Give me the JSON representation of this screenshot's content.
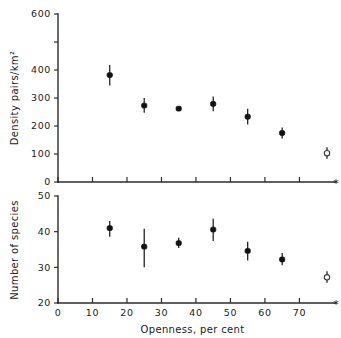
{
  "figure": {
    "name": "density-and-species-vs-openness",
    "background": "#ffffff",
    "marker_color": "#111111",
    "axis_color": "#2b2b2b",
    "end_marker": "*"
  },
  "chart_data": [
    {
      "type": "scatter",
      "panel": "top",
      "title": "",
      "xlabel": "",
      "ylabel": "Density pairs/km²",
      "xlim": [
        0,
        78
      ],
      "ylim": [
        0,
        600
      ],
      "grid": false,
      "legend": null,
      "x_ticks": [
        0,
        10,
        20,
        30,
        40,
        50,
        60,
        70
      ],
      "x_ticklabels": [
        "",
        "",
        "",
        "",
        "",
        "",
        "",
        ""
      ],
      "y_ticks": [
        0,
        100,
        200,
        300,
        400,
        500,
        600
      ],
      "y_ticklabels": [
        "0",
        "100",
        "200",
        "300",
        "400",
        "",
        "600"
      ],
      "x": [
        15,
        25,
        35,
        45,
        55,
        65,
        78
      ],
      "values": [
        382,
        273,
        262,
        279,
        233,
        175,
        103
      ],
      "err_low": [
        345,
        247,
        255,
        253,
        205,
        155,
        83
      ],
      "err_high": [
        418,
        300,
        270,
        305,
        262,
        195,
        124
      ],
      "marker_open": [
        false,
        false,
        false,
        false,
        false,
        false,
        true
      ],
      "annotations": [
        "*"
      ]
    },
    {
      "type": "scatter",
      "panel": "bottom",
      "title": "",
      "xlabel": "Openness, per cent",
      "ylabel": "Number of species",
      "xlim": [
        0,
        78
      ],
      "ylim": [
        20,
        50
      ],
      "grid": false,
      "legend": null,
      "x_ticks": [
        0,
        10,
        20,
        30,
        40,
        50,
        60,
        70
      ],
      "x_ticklabels": [
        "0",
        "10",
        "20",
        "30",
        "40",
        "50",
        "60",
        "70"
      ],
      "y_ticks": [
        20,
        30,
        40,
        50
      ],
      "y_ticklabels": [
        "20",
        "30",
        "40",
        "50"
      ],
      "x": [
        15,
        25,
        35,
        45,
        55,
        65,
        78
      ],
      "values": [
        41.0,
        35.8,
        36.8,
        40.6,
        34.6,
        32.2,
        27.2
      ],
      "err_low": [
        38.6,
        30.0,
        35.4,
        37.4,
        31.9,
        30.6,
        25.7
      ],
      "err_high": [
        43.0,
        40.8,
        38.3,
        43.6,
        37.2,
        34.0,
        28.9
      ],
      "marker_open": [
        false,
        false,
        false,
        false,
        false,
        false,
        true
      ],
      "annotations": [
        "*"
      ]
    }
  ],
  "labels": {
    "top_y_axis": "Density pairs/km²",
    "bottom_y_axis": "Number of species",
    "x_axis": "Openness, per cent"
  }
}
